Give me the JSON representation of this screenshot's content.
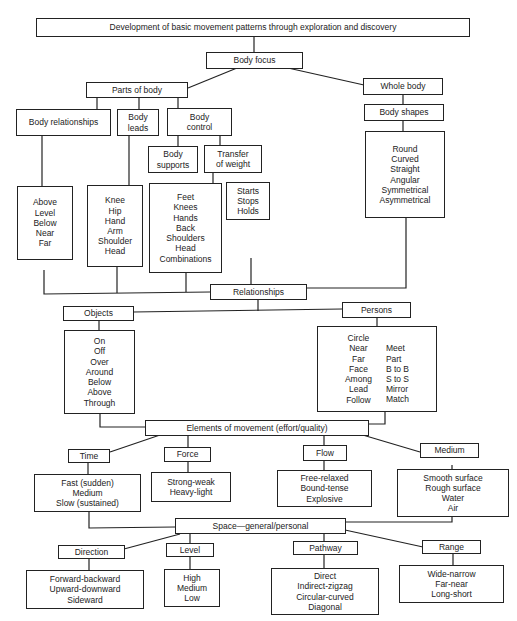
{
  "title": "Development of basic movement patterns through exploration and discovery",
  "body_focus": {
    "label": "Body focus",
    "parts_of_body": {
      "label": "Parts of body",
      "body_relationships": {
        "label": "Body relationships",
        "items": [
          "Above",
          "Level",
          "Below",
          "Near",
          "Far"
        ]
      },
      "body_leads": {
        "label": [
          "Body",
          "leads"
        ],
        "items": [
          "Knee",
          "Hip",
          "Hand",
          "Arm",
          "Shoulder",
          "Head"
        ]
      },
      "body_control": {
        "label": [
          "Body",
          "control"
        ],
        "body_supports": {
          "label": [
            "Body",
            "supports"
          ],
          "items": [
            "Feet",
            "Knees",
            "Hands",
            "Back",
            "Shoulders",
            "Head",
            "Combinations"
          ]
        },
        "transfer_of_weight": {
          "label": [
            "Transfer",
            "of weight"
          ],
          "items": [
            "Starts",
            "Stops",
            "Holds"
          ]
        }
      }
    },
    "whole_body": {
      "label": "Whole body",
      "body_shapes": {
        "label": "Body shapes",
        "items": [
          "Round",
          "Curved",
          "Straight",
          "Angular",
          "Symmetrical",
          "Asymmetrical"
        ]
      }
    }
  },
  "relationships": {
    "label": "Relationships",
    "objects": {
      "label": "Objects",
      "items": [
        "On",
        "Off",
        "Over",
        "Around",
        "Below",
        "Above",
        "Through"
      ]
    },
    "persons": {
      "label": "Persons",
      "items_left": [
        "Circle",
        "Near",
        "Far",
        "Face",
        "Among",
        "Lead",
        "Follow"
      ],
      "items_right": [
        "Meet",
        "Part",
        "B to B",
        "S to S",
        "Mirror",
        "Match"
      ]
    }
  },
  "elements_of_movement": {
    "label": "Elements of movement (effort/quality)",
    "time": {
      "label": "Time",
      "items": [
        "Fast (sudden)",
        "Medium",
        "Slow (sustained)"
      ]
    },
    "force": {
      "label": "Force",
      "items": [
        "Strong-weak",
        "Heavy-light"
      ]
    },
    "flow": {
      "label": "Flow",
      "items": [
        "Free-relaxed",
        "Bound-tense",
        "Explosive"
      ]
    },
    "medium": {
      "label": "Medium",
      "items": [
        "Smooth surface",
        "Rough surface",
        "Water",
        "Air"
      ]
    }
  },
  "space": {
    "label": "Space—general/personal",
    "direction": {
      "label": "Direction",
      "items": [
        "Forward-backward",
        "Upward-downward",
        "Sideward"
      ]
    },
    "level": {
      "label": "Level",
      "items": [
        "High",
        "Medium",
        "Low"
      ]
    },
    "pathway": {
      "label": "Pathway",
      "items": [
        "Direct",
        "Indirect-zigzag",
        "Circular-curved",
        "Diagonal"
      ]
    },
    "range": {
      "label": "Range",
      "items": [
        "Wide-narrow",
        "Far-near",
        "Long-short"
      ]
    }
  }
}
